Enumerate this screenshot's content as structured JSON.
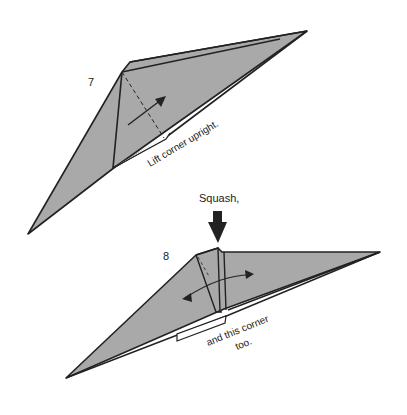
{
  "steps": [
    {
      "number": "7",
      "instruction": "Lift corner upright."
    },
    {
      "number": "8",
      "instruction_top": "Squash,",
      "instruction_bottom_1": "and this corner",
      "instruction_bottom_2": "too."
    }
  ],
  "colors": {
    "paper": "#a9a9a9",
    "line": "#222222",
    "background": "#ffffff"
  }
}
